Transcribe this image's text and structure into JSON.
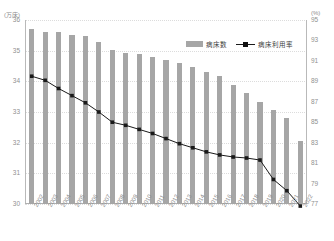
{
  "chart_data": {
    "type": "bar",
    "title": "",
    "subtitle": "",
    "xlabel": "",
    "ylabel": "",
    "grid": true,
    "legend_position": "top-right-inside",
    "categories": [
      "2002",
      "2003",
      "2004",
      "2005",
      "2006",
      "2007",
      "2008",
      "2009",
      "2010",
      "2011",
      "2012",
      "2013",
      "2014",
      "2015",
      "2016",
      "2017",
      "2018",
      "2019",
      "2020",
      "2021",
      "2022"
    ],
    "left_axis": {
      "unit_label": "(万床)",
      "ylim": [
        30,
        36
      ],
      "ticks": [
        "36",
        "35",
        "34",
        "33",
        "32",
        "31",
        "30"
      ],
      "tick_values": [
        36,
        35,
        34,
        33,
        32,
        31,
        30
      ]
    },
    "right_axis": {
      "unit_label": "(%)",
      "ylim": [
        77,
        95
      ],
      "ticks": [
        "95",
        "93",
        "91",
        "89",
        "87",
        "85",
        "83",
        "81",
        "79",
        "77"
      ],
      "tick_values": [
        95,
        93,
        91,
        89,
        87,
        85,
        83,
        81,
        79,
        77
      ]
    },
    "series": [
      {
        "name": "病床数",
        "type": "bar",
        "axis": "left",
        "color": "#a6a6a6",
        "values": [
          35.7,
          35.6,
          35.62,
          35.52,
          35.48,
          35.28,
          35.02,
          34.92,
          34.88,
          34.78,
          34.68,
          34.6,
          34.46,
          34.32,
          34.18,
          33.88,
          33.62,
          33.32,
          33.08,
          32.82,
          32.05
        ]
      },
      {
        "name": "病床利用率",
        "type": "line",
        "axis": "right",
        "color": "#1a1a1a",
        "marker": "square",
        "values": [
          89.5,
          89.1,
          88.3,
          87.6,
          86.9,
          86.0,
          85.0,
          84.7,
          84.3,
          83.9,
          83.4,
          82.9,
          82.5,
          82.1,
          81.8,
          81.6,
          81.5,
          81.3,
          79.4,
          78.3,
          76.8
        ]
      }
    ]
  },
  "legend": {
    "items": [
      {
        "label": "病床数",
        "style": "bar"
      },
      {
        "label": "病床利用率",
        "style": "line"
      }
    ]
  }
}
